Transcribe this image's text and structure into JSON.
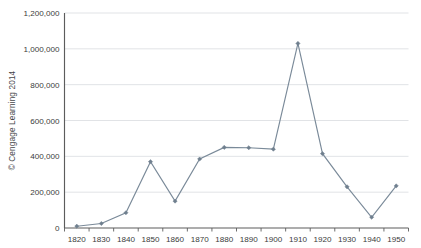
{
  "credit": {
    "text": "© Cengage Learning 2014"
  },
  "chart_data": {
    "type": "line",
    "title": "",
    "subtitle": "",
    "xlabel": "",
    "ylabel": "",
    "categories": [
      "1820",
      "1830",
      "1840",
      "1850",
      "1860",
      "1870",
      "1880",
      "1890",
      "1900",
      "1910",
      "1920",
      "1930",
      "1940",
      "1950"
    ],
    "x": [
      1820,
      1830,
      1840,
      1850,
      1860,
      1870,
      1880,
      1890,
      1900,
      1910,
      1920,
      1930,
      1940,
      1950
    ],
    "values": [
      10000,
      25000,
      85000,
      370000,
      150000,
      385000,
      450000,
      448000,
      440000,
      1030000,
      415000,
      230000,
      60000,
      235000
    ],
    "series": [
      {
        "name": "",
        "values": [
          10000,
          25000,
          85000,
          370000,
          150000,
          385000,
          450000,
          448000,
          440000,
          1030000,
          415000,
          230000,
          60000,
          235000
        ]
      }
    ],
    "ylim": [
      0,
      1200000
    ],
    "ytick_values": [
      0,
      200000,
      400000,
      600000,
      800000,
      1000000,
      1200000
    ],
    "ytick_labels": [
      "0",
      "200,000",
      "400,000",
      "600,000",
      "800,000",
      "1,000,000",
      "1,200,000"
    ],
    "xtick_labels": [
      "1820",
      "1830",
      "1840",
      "1850",
      "1860",
      "1870",
      "1880",
      "1890",
      "1900",
      "1910",
      "1920",
      "1930",
      "1940",
      "1950"
    ],
    "grid": true,
    "grid_axis": "y",
    "legend": false,
    "legend_position": "none",
    "marker": "diamond",
    "line_color": "#7a8a99",
    "marker_color": "#6f7f8e",
    "grid_color": "#d9dcdf",
    "axis_color": "#5c5c5c",
    "background": "#ffffff"
  }
}
